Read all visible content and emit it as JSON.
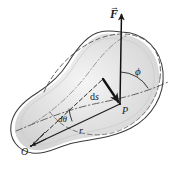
{
  "figure": {
    "background_color": "#ffffff",
    "body_fill_color": "#dcdcdc",
    "body_fill_color_light": "#ebebeb",
    "outline_color": "#3c3c3c",
    "line_color": "#1a1a1a"
  },
  "labels": {
    "force": {
      "text": "F",
      "accent": "→",
      "name": "force-vector-label"
    },
    "angle_phi": {
      "text": "ϕ",
      "name": "angle-phi-label"
    },
    "point_p": {
      "text": "P",
      "name": "point-p-label"
    },
    "displacement": {
      "text": "d",
      "subscript": "s",
      "full": "ds",
      "name": "displacement-ds-label"
    },
    "angle_dtheta": {
      "text": "dθ",
      "name": "angle-dtheta-label"
    },
    "radius": {
      "text": "r",
      "name": "radius-r-label"
    },
    "origin": {
      "text": "O",
      "name": "origin-o-label"
    }
  },
  "geometry": {
    "point_O": {
      "x": 30,
      "y": 146
    },
    "point_P": {
      "x": 119,
      "y": 104
    },
    "ds_start": {
      "x": 103,
      "y": 79
    },
    "force_tip": {
      "x": 122,
      "y": 12
    },
    "force_tail": {
      "x": 120,
      "y": 104
    }
  }
}
